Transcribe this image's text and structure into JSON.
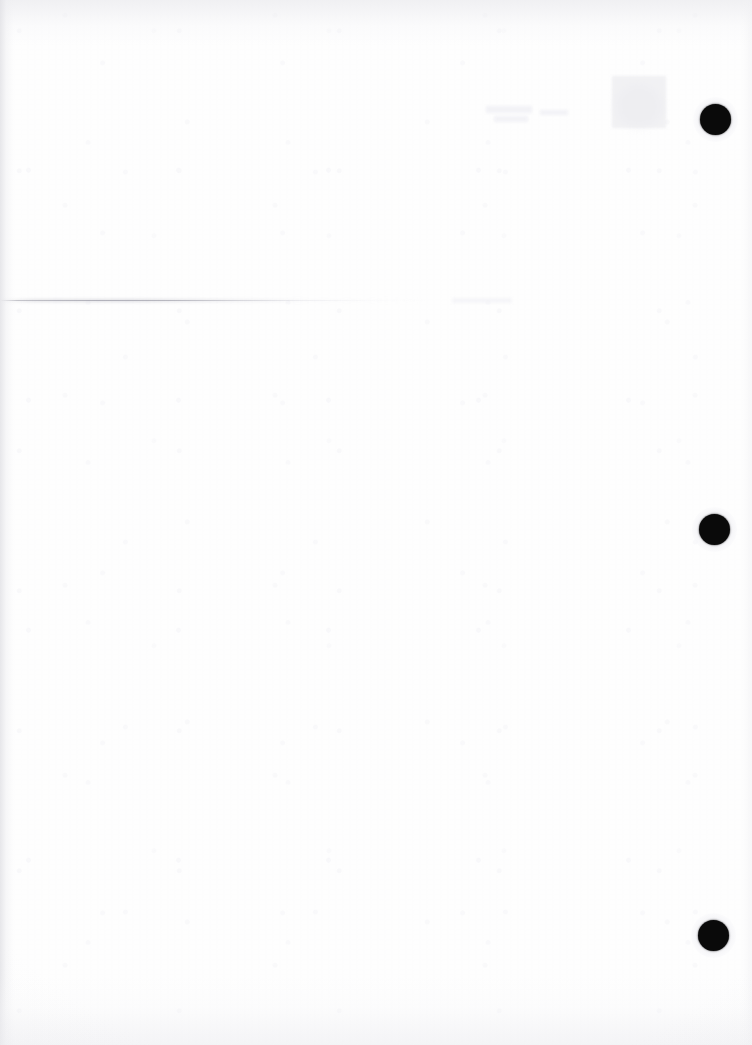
{
  "document": {
    "kind": "scanned-page",
    "title": "",
    "page_content_text": "",
    "visible_text": "",
    "note": ""
  },
  "canvas": {
    "width_px": 752,
    "height_px": 1045,
    "background_color": "#ffffff",
    "paper_tone": "#fefefe"
  },
  "marks": {
    "punch_holes": [
      {
        "name": "punch-hole-top",
        "cx": 716,
        "cy": 120,
        "d": 31,
        "color": "#0a0a0a"
      },
      {
        "name": "punch-hole-middle",
        "cx": 715,
        "cy": 530,
        "d": 31,
        "color": "#0a0a0a"
      },
      {
        "name": "punch-hole-bottom",
        "cx": 714,
        "cy": 936,
        "d": 31,
        "color": "#0a0a0a"
      }
    ],
    "rules": [
      {
        "name": "faint-horizontal-rule",
        "x": 0,
        "y": 300,
        "width": 430,
        "thickness": 1,
        "color": "#a8a8b2"
      }
    ],
    "ghost_marks": [
      {
        "name": "ghost-block-upper-right",
        "x": 612,
        "y": 76,
        "w": 54,
        "h": 52,
        "color": "#ececf0"
      },
      {
        "name": "ghost-text-fragment-1",
        "x": 486,
        "y": 106,
        "w": 46,
        "h": 7,
        "color": "#f1f1f5"
      },
      {
        "name": "ghost-text-fragment-2",
        "x": 494,
        "y": 116,
        "w": 34,
        "h": 6,
        "color": "#f1f1f5"
      },
      {
        "name": "ghost-text-fragment-3",
        "x": 540,
        "y": 110,
        "w": 28,
        "h": 5,
        "color": "#f3f3f6"
      },
      {
        "name": "ghost-smudge-right",
        "x": 618,
        "y": 86,
        "w": 42,
        "h": 40,
        "color": "#efeff3"
      }
    ],
    "edge_shading": {
      "left_color": "#e1e1e5",
      "top_color": "#e8e8ec",
      "bottom_color": "#ececf0",
      "right_color": "#f0f0f3"
    }
  }
}
